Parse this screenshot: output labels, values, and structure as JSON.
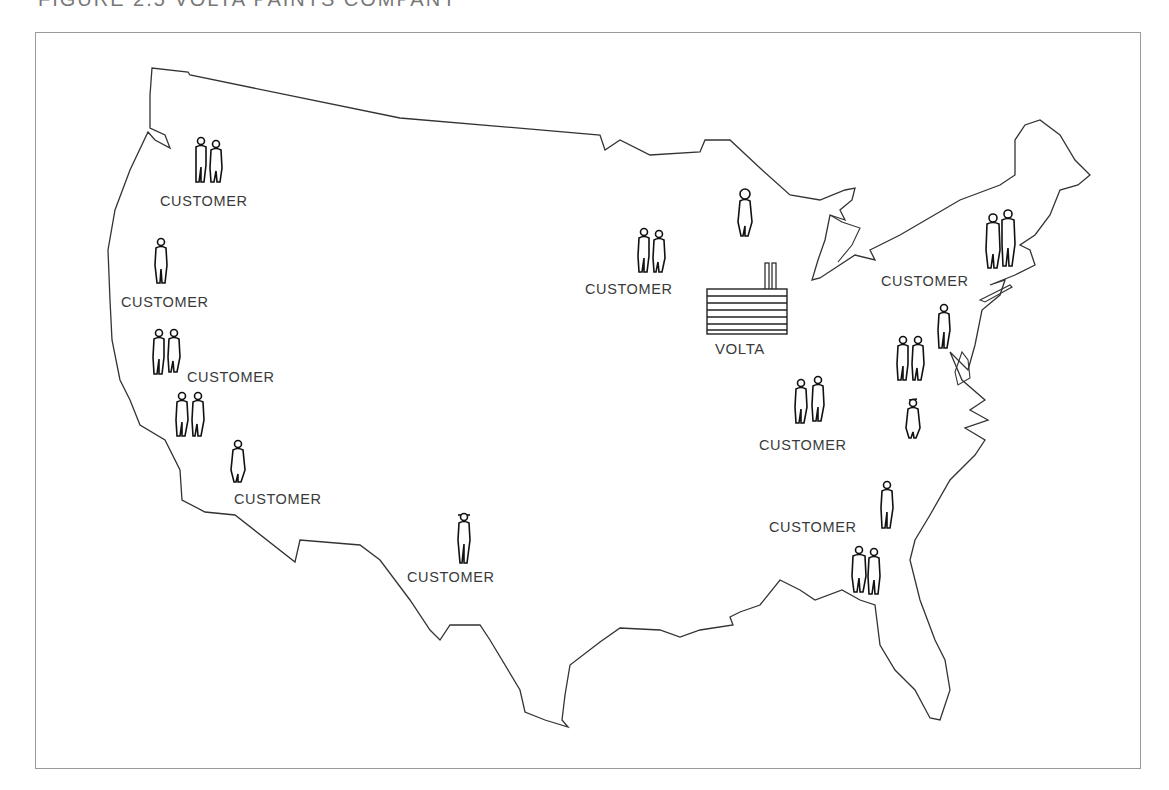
{
  "figure": {
    "title": "FIGURE 2.5   VOLTA PAINTS COMPANY"
  },
  "map": {
    "subject": "United States outline",
    "colors": {
      "outline": "#333333",
      "frame": "#9a9a9a",
      "text": "#3a3a3a"
    }
  },
  "factory": {
    "label": "VOLTA",
    "icon": "factory-icon"
  },
  "customers": [
    {
      "id": "pacific-northwest",
      "label": "CUSTOMER",
      "figures": 2
    },
    {
      "id": "oregon",
      "label": "CUSTOMER",
      "figures": 1
    },
    {
      "id": "northern-california",
      "label": "CUSTOMER",
      "figures": 2
    },
    {
      "id": "central-california",
      "label": "",
      "figures": 2
    },
    {
      "id": "southern-california",
      "label": "CUSTOMER",
      "figures": 1
    },
    {
      "id": "texas",
      "label": "CUSTOMER",
      "figures": 1
    },
    {
      "id": "midwest",
      "label": "CUSTOMER",
      "figures": 2
    },
    {
      "id": "great-lakes",
      "label": "",
      "figures": 1
    },
    {
      "id": "new-england",
      "label": "CUSTOMER",
      "figures": 2
    },
    {
      "id": "new-york",
      "label": "",
      "figures": 1
    },
    {
      "id": "mid-atlantic",
      "label": "",
      "figures": 2
    },
    {
      "id": "virginia",
      "label": "",
      "figures": 1
    },
    {
      "id": "ohio-valley",
      "label": "CUSTOMER",
      "figures": 2
    },
    {
      "id": "carolinas",
      "label": "CUSTOMER",
      "figures": 1
    },
    {
      "id": "southeast",
      "label": "",
      "figures": 2
    }
  ]
}
